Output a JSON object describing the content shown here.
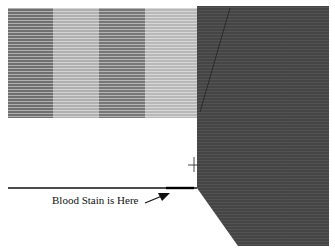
{
  "figure": {
    "label": "Blood Stain is Here",
    "colors": {
      "band_dark": "#6e6e6e",
      "band_light": "#b4b4b4",
      "block": "#454545",
      "line": "#111111"
    },
    "elements": [
      {
        "name": "striped-wall",
        "type": "striped-rectangle",
        "bands": 4
      },
      {
        "name": "dark-block",
        "type": "polygon"
      },
      {
        "name": "floor-line",
        "type": "line"
      },
      {
        "name": "crosshair-marker",
        "type": "plus"
      },
      {
        "name": "pointer-arrow",
        "type": "arrow"
      }
    ]
  }
}
